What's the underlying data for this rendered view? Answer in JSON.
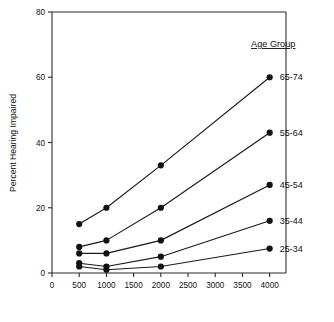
{
  "chart_data": {
    "type": "line",
    "title": "",
    "xlabel": "",
    "ylabel": "Percent Hearing Impaired",
    "legend_title": "Age Group",
    "legend_position": "right-inside-direct-labels",
    "grid": false,
    "x": [
      500,
      1000,
      2000,
      4000
    ],
    "xlim": [
      0,
      4300
    ],
    "ylim": [
      0,
      80
    ],
    "xticks": [
      0,
      500,
      1000,
      1500,
      2000,
      2500,
      3000,
      3500,
      4000
    ],
    "xticklabels": [
      "0",
      "500",
      "1000",
      "1500",
      "2000",
      "2500",
      "3000",
      "3500",
      "4000"
    ],
    "yticks": [
      0,
      20,
      40,
      60,
      80
    ],
    "yticklabels": [
      "0",
      "20",
      "40",
      "60",
      "80"
    ],
    "series": [
      {
        "name": "65-74",
        "values": [
          15,
          20,
          33,
          60
        ]
      },
      {
        "name": "55-64",
        "values": [
          8,
          10,
          20,
          43
        ]
      },
      {
        "name": "45-54",
        "values": [
          6,
          6,
          10,
          27
        ]
      },
      {
        "name": "35-44",
        "values": [
          3,
          2,
          5,
          16
        ]
      },
      {
        "name": "25-34",
        "values": [
          2,
          1,
          2,
          7.5
        ]
      }
    ]
  },
  "axes": {
    "y_title": "Percent Hearing Impaired"
  },
  "legend": {
    "title": "Age Group",
    "entries": [
      {
        "label": "65-74"
      },
      {
        "label": "55-64"
      },
      {
        "label": "45-54"
      },
      {
        "label": "35-44"
      },
      {
        "label": "25-34"
      }
    ]
  }
}
